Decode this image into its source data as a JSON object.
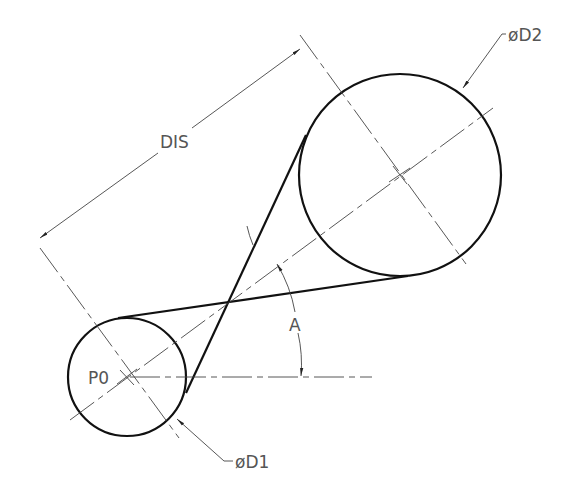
{
  "drawing": {
    "labels": {
      "distance": "DIS",
      "diameter_large": "øD2",
      "diameter_small": "øD1",
      "angle": "A",
      "origin_point": "P0"
    },
    "geometry": {
      "small_circle": {
        "cx": 127,
        "cy": 377,
        "r": 59
      },
      "large_circle": {
        "cx": 400,
        "cy": 175,
        "r": 101
      },
      "belt_type": "crossed"
    },
    "colors": {
      "line": "#111111",
      "thin_line": "#444444",
      "text": "#555555",
      "background": "#ffffff"
    }
  }
}
